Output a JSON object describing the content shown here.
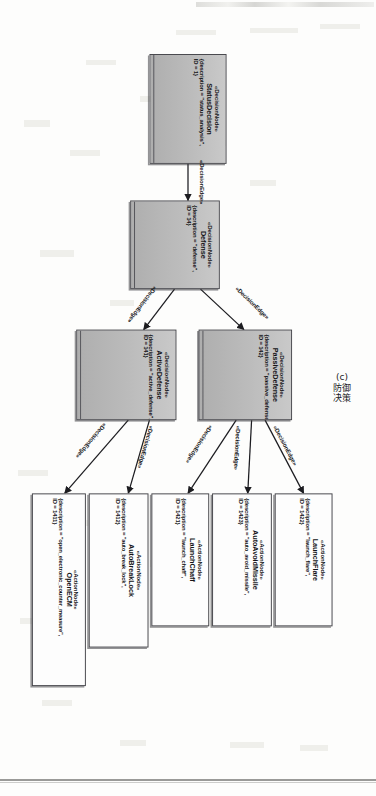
{
  "figure": {
    "caption_index": "(c)",
    "caption_text": "防御决策",
    "edge_stereotype": "«DecisionEdge»"
  },
  "nodes": [
    {
      "id": "status-decision",
      "kind": "decision",
      "stereotype": "«DecisionNode»",
      "name": "StatusDecision",
      "attr_description": "{description = \"status_analysis\",",
      "attr_id": "ID = 1}"
    },
    {
      "id": "defense",
      "kind": "decision",
      "stereotype": "«DecisionNode»",
      "name": "Defense",
      "attr_description": "{description = \"defense\",",
      "attr_id": "ID = 14}"
    },
    {
      "id": "passive-defense",
      "kind": "decision",
      "stereotype": "«DecisionNode»",
      "name": "PassiveDefense",
      "attr_description": "{description = \"passive_defense\",",
      "attr_id": "ID = 142}"
    },
    {
      "id": "active-defense",
      "kind": "decision",
      "stereotype": "«DecisionNode»",
      "name": "ActiveDefense",
      "attr_description": "{description = \"active_defense\",",
      "attr_id": "ID = 141}"
    },
    {
      "id": "launch-flare",
      "kind": "action",
      "stereotype": "«ActionNode»",
      "name": "LaunchFlare",
      "attr_description": "{description = \"launch_flare\",",
      "attr_id": "ID = 1422}"
    },
    {
      "id": "auto-avoid-missile",
      "kind": "action",
      "stereotype": "«ActionNode»",
      "name": "AutoAvoidMissile",
      "attr_description": "{description = \"auto_avoid_missile\",",
      "attr_id": "ID = 1423}"
    },
    {
      "id": "launch-chaff",
      "kind": "action",
      "stereotype": "«ActionNode»",
      "name": "LaunchChaff",
      "attr_description": "{description = \"launch_chaff\",",
      "attr_id": "ID = 1421}"
    },
    {
      "id": "auto-break-lock",
      "kind": "action",
      "stereotype": "«ActionNode»",
      "name": "AutoBreakLock",
      "attr_description": "{description = \"auto_break_lock\",",
      "attr_id": "ID = 1412}"
    },
    {
      "id": "open-ecm",
      "kind": "action",
      "stereotype": "«ActionNode»",
      "name": "OpenECM",
      "attr_description": "{description = \"open_electronic_counter_measure\",",
      "attr_id": "ID = 1411}"
    }
  ],
  "edges": [
    {
      "from": "status-decision",
      "to": "defense",
      "label": "«DecisionEdge»"
    },
    {
      "from": "defense",
      "to": "passive-defense",
      "label": "«DecisionEdge»"
    },
    {
      "from": "defense",
      "to": "active-defense",
      "label": "«DecisionEdge»"
    },
    {
      "from": "passive-defense",
      "to": "launch-flare",
      "label": "«DecisionEdge»"
    },
    {
      "from": "passive-defense",
      "to": "auto-avoid-missile",
      "label": "«DecisionEdge»"
    },
    {
      "from": "passive-defense",
      "to": "launch-chaff",
      "label": "«DecisionEdge»"
    },
    {
      "from": "active-defense",
      "to": "auto-break-lock",
      "label": "«DecisionEdge»"
    },
    {
      "from": "active-defense",
      "to": "open-ecm",
      "label": "«DecisionEdge»"
    }
  ]
}
